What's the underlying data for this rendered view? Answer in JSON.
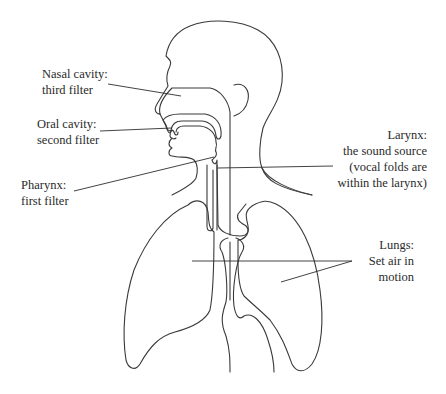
{
  "diagram": {
    "labels": {
      "nasal": {
        "line1": "Nasal cavity:",
        "line2": "third filter"
      },
      "oral": {
        "line1": "Oral cavity:",
        "line2": "second filter"
      },
      "pharynx": {
        "line1": "Pharynx:",
        "line2": "first filter"
      },
      "larynx": {
        "line1": "Larynx:",
        "line2": "the sound source",
        "line3": "(vocal folds are",
        "line4": "within the larynx)"
      },
      "lungs": {
        "line1": "Lungs:",
        "line2": "Set air in",
        "line3": "motion"
      }
    },
    "colors": {
      "stroke": "#3a3a3a",
      "background": "#ffffff",
      "text": "#2a2a2a"
    }
  }
}
